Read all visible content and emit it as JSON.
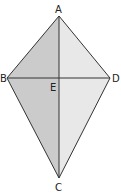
{
  "caption": "",
  "diagram": {
    "type": "kite",
    "vertices": {
      "A": {
        "label": "A",
        "x": 59,
        "y": 16
      },
      "B": {
        "label": "B",
        "x": 7,
        "y": 78
      },
      "C": {
        "label": "C",
        "x": 59,
        "y": 178
      },
      "D": {
        "label": "D",
        "x": 110,
        "y": 78
      },
      "E": {
        "label": "E",
        "x": 59,
        "y": 78
      }
    },
    "fill_left": "#cbcbcb",
    "fill_right": "#e8e8e8",
    "stroke": "#333333",
    "diagonals": [
      "AC",
      "BD"
    ]
  }
}
